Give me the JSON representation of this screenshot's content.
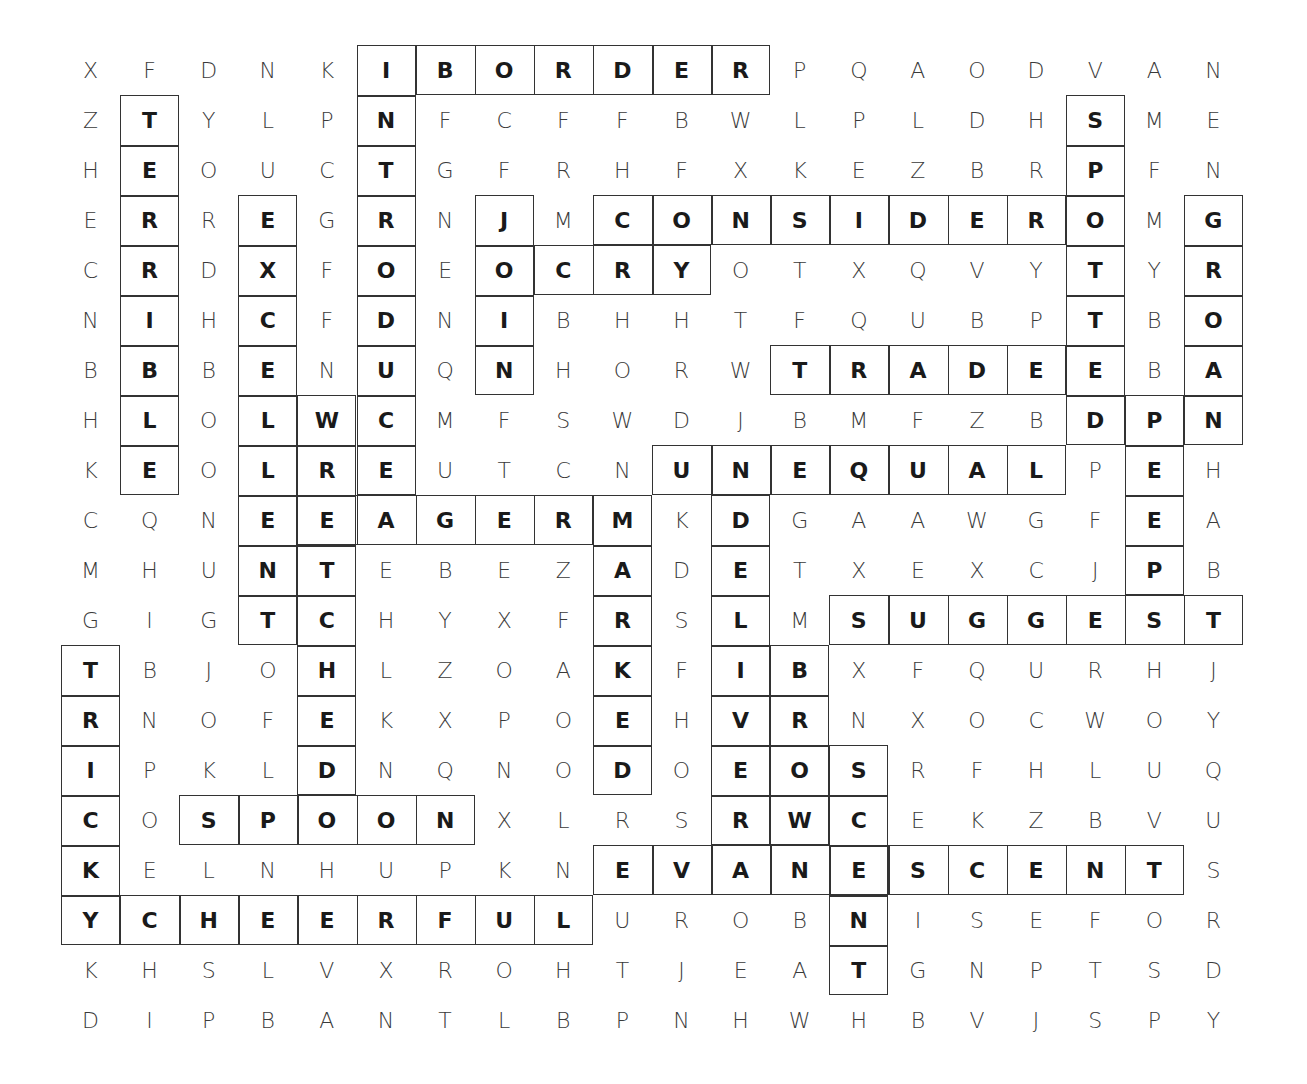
{
  "puzzle": {
    "type": "word-search",
    "rows": 20,
    "cols": 20,
    "grid": [
      "XFDNKIBORDERPQAODVAN",
      "ZTYLPNFCFFBWLPLDHSME",
      "HEOUCTGFRHFXKEZBRPFN",
      "ERREGRNJMCONSIDEROMG",
      "CRDXFOEOCRYOTXQVYTYR",
      "NIHCFDNIBHHTFQUBPTBO",
      "BBBENUQNHORWTRADEEBA",
      "HLOLWCMFSWDJBMFZBDPN",
      "KEOLREUTCNUNEQUALPEH",
      "CQNEEAGERMKDGAAWGFEA",
      "MHUNTEBEZADETXEXCJPB",
      "GIGTCHYXFRSLMSUGGEST",
      "TBJOHLZOAKFIBXFQURHJ",
      "RNOFEKXPOEHVRNXOCWOY",
      "IPKLDNQNODOEOSRFHLUQ",
      "COSPOONXLRSRWCEKZBVU",
      "KELNHUPKNEVANESCENTS",
      "YCHEERFULUROBNISEFOR",
      "KHSLVXROHTJEATGNPTSD",
      "DIPBANTLBPNHWHBVJSPY"
    ],
    "found_words": [
      {
        "word": "BORDER",
        "row": 0,
        "col": 6,
        "dir": "across"
      },
      {
        "word": "INTRODUCE",
        "row": 0,
        "col": 5,
        "dir": "down"
      },
      {
        "word": "TERRIBLE",
        "row": 1,
        "col": 1,
        "dir": "down"
      },
      {
        "word": "SPOTTED",
        "row": 1,
        "col": 17,
        "dir": "down"
      },
      {
        "word": "CONSIDER",
        "row": 3,
        "col": 9,
        "dir": "across"
      },
      {
        "word": "JOIN",
        "row": 3,
        "col": 7,
        "dir": "down"
      },
      {
        "word": "CRY",
        "row": 4,
        "col": 8,
        "dir": "across"
      },
      {
        "word": "GROAN",
        "row": 3,
        "col": 19,
        "dir": "down"
      },
      {
        "word": "EXCELLENT",
        "row": 3,
        "col": 3,
        "dir": "down"
      },
      {
        "word": "TRADE",
        "row": 6,
        "col": 12,
        "dir": "across"
      },
      {
        "word": "WRETCHED",
        "row": 7,
        "col": 4,
        "dir": "down"
      },
      {
        "word": "PEEP",
        "row": 7,
        "col": 18,
        "dir": "down"
      },
      {
        "word": "UNEQUAL",
        "row": 8,
        "col": 10,
        "dir": "across"
      },
      {
        "word": "EAGER",
        "row": 9,
        "col": 4,
        "dir": "across"
      },
      {
        "word": "MARKED",
        "row": 9,
        "col": 9,
        "dir": "down"
      },
      {
        "word": "DELIVER",
        "row": 9,
        "col": 11,
        "dir": "down"
      },
      {
        "word": "SUGGEST",
        "row": 11,
        "col": 13,
        "dir": "across"
      },
      {
        "word": "BROW",
        "row": 12,
        "col": 12,
        "dir": "down"
      },
      {
        "word": "TRICKY",
        "row": 12,
        "col": 0,
        "dir": "down"
      },
      {
        "word": "SCENT",
        "row": 14,
        "col": 13,
        "dir": "down"
      },
      {
        "word": "SPOON",
        "row": 15,
        "col": 2,
        "dir": "across"
      },
      {
        "word": "EVANESCENT",
        "row": 16,
        "col": 9,
        "dir": "across"
      },
      {
        "word": "CHEERFUL",
        "row": 17,
        "col": 1,
        "dir": "across"
      }
    ]
  }
}
